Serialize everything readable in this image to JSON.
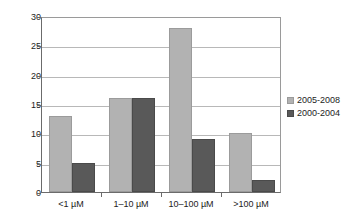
{
  "chart_data": {
    "type": "bar",
    "title": "",
    "xlabel": "",
    "ylabel": "",
    "categories": [
      "<1 µM",
      "1–10 µM",
      "10–100 µM",
      ">100 µM"
    ],
    "series": [
      {
        "name": "2005-2008",
        "values": [
          13,
          16,
          28,
          10
        ],
        "color": "#b2b2b2"
      },
      {
        "name": "2000-2004",
        "values": [
          5,
          16,
          9,
          2
        ],
        "color": "#595959"
      }
    ],
    "ylim": [
      0,
      30
    ],
    "yticks": [
      0,
      5,
      10,
      15,
      20,
      25,
      30
    ],
    "ytick_labels": [
      "0",
      "5",
      "10",
      "15",
      "20",
      "25",
      "30"
    ],
    "grid": true,
    "legend_position": "right",
    "legend_entries": [
      "2005-2008",
      "2000-2004"
    ]
  }
}
